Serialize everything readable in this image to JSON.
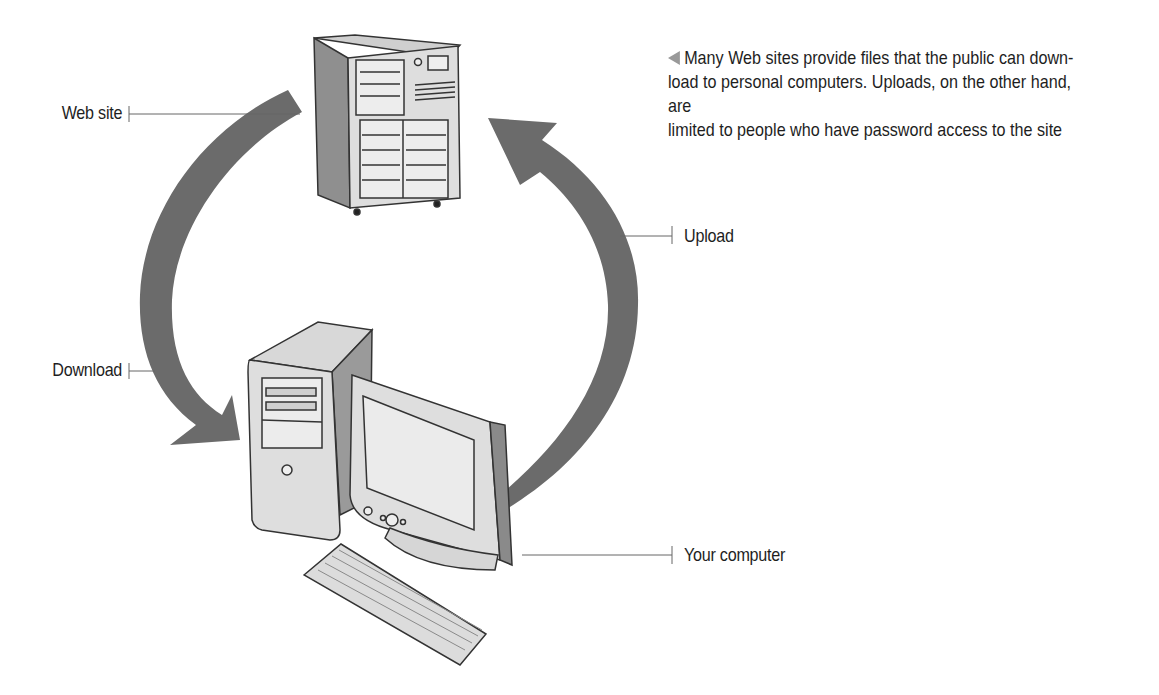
{
  "figure": {
    "caption": {
      "marker_icon": "left-triangle",
      "lines": [
        "Many Web sites provide files that the public can down-",
        "load to personal computers. Uploads, on the other hand, are",
        "limited to people who have password access to the site"
      ]
    },
    "labels": {
      "web_site": "Web site",
      "download": "Download",
      "upload": "Upload",
      "your_computer": "Your computer"
    },
    "colors": {
      "arrow": "#6b6b6b",
      "device_fill": "#dcdcdc",
      "device_shade": "#9a9a9a",
      "caption_marker": "#999999"
    }
  }
}
